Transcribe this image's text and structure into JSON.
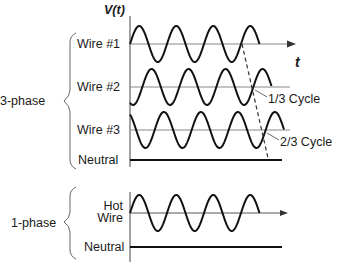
{
  "diagram": {
    "axis_label_y": "V(t)",
    "axis_label_x": "t",
    "groups": [
      {
        "name": "3-phase",
        "wires": [
          {
            "label": "Wire #1",
            "phase_offset_cycles": 0
          },
          {
            "label": "Wire #2",
            "phase_offset_cycles": 0.3333
          },
          {
            "label": "Wire #3",
            "phase_offset_cycles": 0.6667
          },
          {
            "label": "Neutral",
            "phase_offset_cycles": null
          }
        ]
      },
      {
        "name": "1-phase",
        "wires": [
          {
            "label_line1": "Hot",
            "label_line2": "Wire",
            "phase_offset_cycles": 0
          },
          {
            "label": "Neutral",
            "phase_offset_cycles": null
          }
        ]
      }
    ],
    "annotations": [
      "1/3 Cycle",
      "2/3 Cycle"
    ],
    "colors": {
      "waveform": "#111111",
      "baseline": "#888888",
      "dashed": "#333333"
    }
  }
}
